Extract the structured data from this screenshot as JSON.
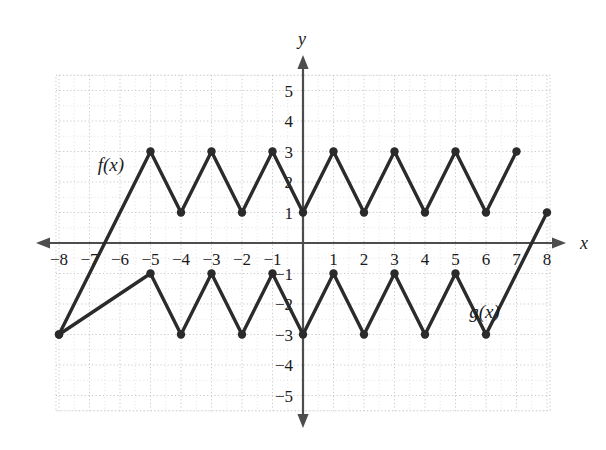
{
  "figure": {
    "background_color": "#ffffff",
    "axis_color": "#4d4d4d",
    "grid_major_color": "#c8c8c8",
    "grid_minor_color": "#d8d8d8",
    "curve_color": "#2b2b2b",
    "text_color": "#1a1a1a"
  },
  "axes": {
    "x_axis_name": "x",
    "y_axis_name": "y",
    "x_tick_labels": [
      "−8",
      "−7",
      "−6",
      "−5",
      "−4",
      "−3",
      "−2",
      "−1",
      "1",
      "2",
      "3",
      "4",
      "5",
      "6",
      "7",
      "8"
    ],
    "x_tick_values": [
      -8,
      -7,
      -6,
      -5,
      -4,
      -3,
      -2,
      -1,
      1,
      2,
      3,
      4,
      5,
      6,
      7,
      8
    ],
    "y_tick_labels": [
      "5",
      "4",
      "3",
      "2",
      "1",
      "−1",
      "−2",
      "−3",
      "−4",
      "−5"
    ],
    "y_tick_values": [
      5,
      4,
      3,
      2,
      1,
      -1,
      -2,
      -3,
      -4,
      -5
    ]
  },
  "chart_data": {
    "type": "line",
    "title": "",
    "xlabel": "x",
    "ylabel": "y",
    "xlim": [
      -8.1,
      8.1
    ],
    "ylim": [
      -5.5,
      5.5
    ],
    "grid": true,
    "grid_minor_step": 0.5,
    "grid_major_step": 1,
    "legend": "inline-labels",
    "series": [
      {
        "name": "f(x)",
        "label": "f(x)",
        "label_x": -6.3,
        "label_y": 2.35,
        "marker": "filled-circle",
        "x": [
          -8,
          -5,
          -4,
          -3,
          -2,
          -1,
          0,
          1,
          2,
          3,
          4,
          5,
          6,
          7
        ],
        "y": [
          -3,
          3,
          1,
          3,
          1,
          3,
          1,
          3,
          1,
          3,
          1,
          3,
          1,
          3
        ],
        "marked_points": [
          {
            "x": -8,
            "y": -3
          },
          {
            "x": -5,
            "y": 3
          },
          {
            "x": -4,
            "y": 1
          },
          {
            "x": -3,
            "y": 3
          },
          {
            "x": -2,
            "y": 1
          },
          {
            "x": -1,
            "y": 3
          },
          {
            "x": 0,
            "y": 1
          },
          {
            "x": 1,
            "y": 3
          },
          {
            "x": 2,
            "y": 1
          },
          {
            "x": 3,
            "y": 3
          },
          {
            "x": 4,
            "y": 1
          },
          {
            "x": 5,
            "y": 3
          },
          {
            "x": 6,
            "y": 1
          },
          {
            "x": 7,
            "y": 3
          }
        ]
      },
      {
        "name": "g(x)",
        "label": "g(x)",
        "label_x": 5.95,
        "label_y": -2.45,
        "marker": "filled-circle",
        "x": [
          -8,
          -5,
          -4,
          -3,
          -2,
          -1,
          0,
          1,
          2,
          3,
          4,
          5,
          6,
          8
        ],
        "y": [
          -3,
          -1,
          -3,
          -1,
          -3,
          -1,
          -3,
          -1,
          -3,
          -1,
          -3,
          -1,
          -3,
          1
        ],
        "marked_points": [
          {
            "x": -8,
            "y": -3
          },
          {
            "x": -5,
            "y": -1
          },
          {
            "x": -4,
            "y": -3
          },
          {
            "x": -3,
            "y": -1
          },
          {
            "x": -2,
            "y": -3
          },
          {
            "x": -1,
            "y": -1
          },
          {
            "x": 0,
            "y": -3
          },
          {
            "x": 1,
            "y": -1
          },
          {
            "x": 2,
            "y": -3
          },
          {
            "x": 3,
            "y": -1
          },
          {
            "x": 4,
            "y": -3
          },
          {
            "x": 5,
            "y": -1
          },
          {
            "x": 6,
            "y": -3
          },
          {
            "x": 8,
            "y": 1
          }
        ]
      }
    ]
  }
}
